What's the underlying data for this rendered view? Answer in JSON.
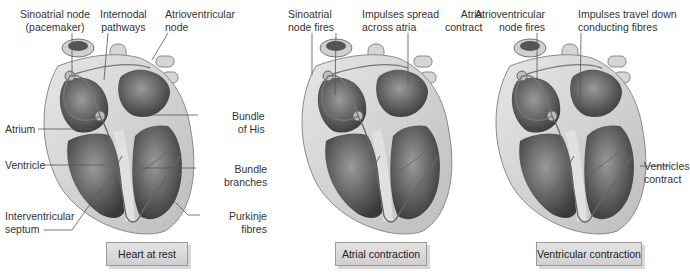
{
  "panels": [
    {
      "caption": "Heart at rest",
      "labels": {
        "sa_node": [
          "Sinoatrial node",
          "(pacemaker)"
        ],
        "internodal": [
          "Internodal",
          "pathways"
        ],
        "av_node": [
          "Atrioventricular",
          "node"
        ],
        "atrium": "Atrium",
        "ventricle": "Ventricle",
        "septum": [
          "Interventricular",
          "septum"
        ],
        "bundle_his": [
          "Bundle",
          "of His"
        ],
        "bundle_branches": [
          "Bundle",
          "branches"
        ],
        "purkinje": [
          "Purkinje",
          "fibres"
        ]
      }
    },
    {
      "caption": "Atrial contraction",
      "labels": {
        "sa_fires": [
          "Sinoatrial",
          "node fires"
        ],
        "spread": [
          "Impulses spread",
          "across atria"
        ],
        "atria_contract": [
          "Atria",
          "contract"
        ]
      }
    },
    {
      "caption": "Ventricular contraction",
      "labels": {
        "av_fires": [
          "Atrioventricular",
          "node fires"
        ],
        "travel": [
          "Impulses travel down",
          "conducting fibres"
        ],
        "ventricles_contract": [
          "Ventricles",
          "contract"
        ]
      }
    }
  ],
  "colors": {
    "caption_bg": "#d9d9d9",
    "heart_wall": "#d6d6d6",
    "chamber": "#6e6e6e",
    "leader_line": "#555555"
  }
}
